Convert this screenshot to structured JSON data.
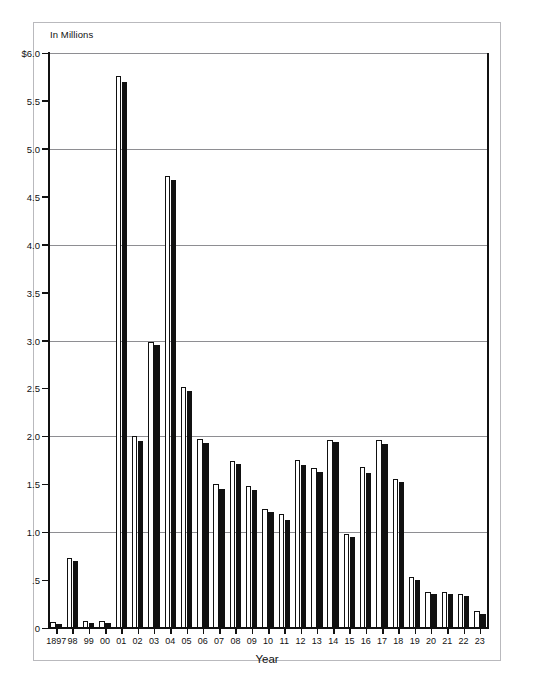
{
  "chart_data": {
    "type": "bar",
    "title": "",
    "subtitle": "",
    "xlabel": "Year",
    "ylabel": "In Millions",
    "ylim": [
      0,
      6.0
    ],
    "ytick_labels": [
      "$6.0",
      "5.5",
      "5.0",
      "4.5",
      "4.0",
      "3.5",
      "3.0",
      "2.5",
      "2.0",
      "1.5",
      "1.0",
      ".5",
      "0"
    ],
    "ytick_values": [
      6.0,
      5.5,
      5.0,
      4.5,
      4.0,
      3.5,
      3.0,
      2.5,
      2.0,
      1.5,
      1.0,
      0.5,
      0
    ],
    "gridline_values": [
      6.0,
      5.0,
      4.0,
      3.0,
      2.0,
      1.0
    ],
    "grid": true,
    "legend": "none",
    "categories": [
      "1897",
      "98",
      "99",
      "00",
      "01",
      "02",
      "03",
      "04",
      "05",
      "06",
      "07",
      "08",
      "09",
      "10",
      "11",
      "12",
      "13",
      "14",
      "15",
      "16",
      "17",
      "18",
      "19",
      "20",
      "21",
      "22",
      "23"
    ],
    "series": [
      {
        "name": "white-bar",
        "style": "outlined",
        "values": [
          0.06,
          0.73,
          0.07,
          0.07,
          5.76,
          2.0,
          2.98,
          4.72,
          2.51,
          1.97,
          1.5,
          1.74,
          1.48,
          1.24,
          1.19,
          1.75,
          1.67,
          1.96,
          0.98,
          1.68,
          1.96,
          1.56,
          0.53,
          0.38,
          0.38,
          0.35,
          0.18
        ]
      },
      {
        "name": "black-bar",
        "style": "filled",
        "values": [
          0.04,
          0.7,
          0.05,
          0.05,
          5.7,
          1.95,
          2.95,
          4.68,
          2.47,
          1.93,
          1.45,
          1.71,
          1.44,
          1.21,
          1.13,
          1.7,
          1.63,
          1.94,
          0.95,
          1.62,
          1.92,
          1.52,
          0.5,
          0.35,
          0.35,
          0.33,
          0.15
        ]
      }
    ]
  }
}
